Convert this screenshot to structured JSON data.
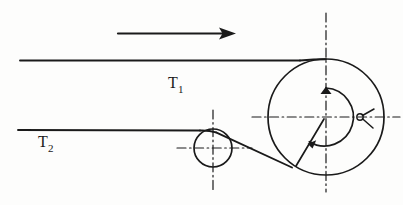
{
  "figure": {
    "background_color": "#fdfdfc",
    "ink_color": "#1a1a1a"
  },
  "labels": {
    "tension_upper": {
      "base": "T",
      "subscript": "1",
      "x": 168,
      "y": 88
    },
    "tension_lower": {
      "base": "T",
      "subscript": "2",
      "x": 38,
      "y": 147
    }
  },
  "direction_arrow": {
    "name": "motion-direction-arrow",
    "x_start": 118,
    "x_end": 232,
    "y": 33,
    "points_to": "right"
  },
  "belts": {
    "upper_span": {
      "x_start": 20,
      "x_end": 326,
      "y": 60,
      "label_ref": "tension_upper"
    },
    "lower_span": {
      "x_start": 18,
      "x_end": 213,
      "y": 130,
      "label_ref": "tension_lower"
    },
    "diagonal_span": {
      "x_start": 231,
      "y_start": 137,
      "x_end": 292,
      "y_end": 167
    }
  },
  "pulleys": [
    {
      "name": "driver-pulley-large",
      "center_x": 326,
      "center_y": 117,
      "radius": 58,
      "inner_radius": 29
    },
    {
      "name": "idler-pulley-small",
      "center_x": 213,
      "center_y": 148,
      "radius": 19
    }
  ],
  "centerlines": {
    "large_vertical": {
      "x": 326,
      "y_start": 13,
      "y_end": 192
    },
    "large_horizontal": {
      "y": 117,
      "x_start": 252,
      "x_end": 400
    },
    "small_vertical": {
      "x": 213,
      "y_start": 110,
      "y_end": 192
    },
    "small_horizontal": {
      "y": 148,
      "x_start": 177,
      "x_end": 252
    }
  },
  "wrap_angle_arc": {
    "name": "wrap-angle-arc",
    "center_x": 326,
    "center_y": 117,
    "radius": 29,
    "start_angle_deg": 270,
    "end_angle_deg": 125,
    "has_arrowhead_start": true,
    "has_arrowhead_end": true
  },
  "radius_marker": {
    "name": "radius-leader-line",
    "x_start": 326,
    "y_start": 117,
    "x_end": 296,
    "y_end": 165
  },
  "angle_tick": {
    "name": "angle-tick-mark",
    "x": 364,
    "y": 121
  }
}
